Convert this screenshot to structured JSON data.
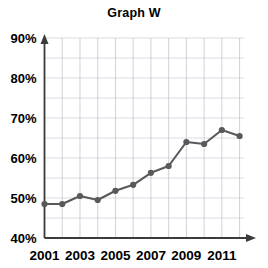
{
  "chart_data": {
    "type": "line",
    "title": "Graph W",
    "xlabel": "",
    "ylabel": "",
    "x": [
      2001,
      2002,
      2003,
      2004,
      2005,
      2006,
      2007,
      2008,
      2009,
      2010,
      2011,
      2012
    ],
    "categories": [
      "2001",
      "2002",
      "2003",
      "2004",
      "2005",
      "2006",
      "2007",
      "2008",
      "2009",
      "2010",
      "2011",
      "2012"
    ],
    "values": [
      48.5,
      48.5,
      50.5,
      49.5,
      51.8,
      53.3,
      56.3,
      58.0,
      64.0,
      63.5,
      67.0,
      65.5
    ],
    "series": [
      {
        "name": "Graph W",
        "values": [
          48.5,
          48.5,
          50.5,
          49.5,
          51.8,
          53.3,
          56.3,
          58.0,
          64.0,
          63.5,
          67.0,
          65.5
        ]
      }
    ],
    "ylim": [
      40,
      90
    ],
    "xlim": [
      2001,
      2012.7
    ],
    "ytick_values": [
      40,
      50,
      60,
      70,
      80,
      90
    ],
    "ytick_labels": [
      "40%",
      "50%",
      "60%",
      "70%",
      "80%",
      "90%"
    ],
    "y_minor_step": 5,
    "xtick_values": [
      2001,
      2003,
      2005,
      2007,
      2009,
      2011
    ],
    "xtick_labels": [
      "2001",
      "2003",
      "2005",
      "2007",
      "2009",
      "2011"
    ],
    "x_gridline_values": [
      2001,
      2002,
      2003,
      2004,
      2005,
      2006,
      2007,
      2008,
      2009,
      2010,
      2011,
      2012
    ],
    "grid": true,
    "legend": "none",
    "line_color": "#595959",
    "marker_color": "#595959",
    "grid_color": "#c6ccd4",
    "axis_color": "#3b3b3b",
    "background_color": "#ffffff",
    "marker_radius": 3.1,
    "axis_arrows": true
  }
}
